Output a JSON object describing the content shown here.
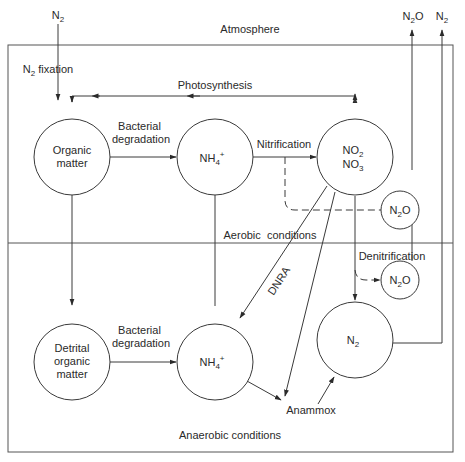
{
  "zones": {
    "atmosphere": "Atmosphere",
    "aerobic": "Aerobic  conditions",
    "anaerobic": "Anaerobic conditions"
  },
  "nodes": {
    "n2_in": {
      "base": "N",
      "sub": "2"
    },
    "n2o_out": {
      "base": "N",
      "sub": "2",
      "tail": "O"
    },
    "n2_out": {
      "base": "N",
      "sub": "2"
    },
    "organic_matter": {
      "line1": "Organic",
      "line2": "matter"
    },
    "nh4_top": {
      "base": "NH",
      "sub": "4",
      "sup": "+"
    },
    "no2_no3": {
      "line1_base": "NO",
      "line1_sub": "2",
      "line2_base": "NO",
      "line2_sub": "3"
    },
    "n2o_upper": {
      "base": "N",
      "sub": "2",
      "tail": "O"
    },
    "n2o_lower": {
      "base": "N",
      "sub": "2",
      "tail": "O"
    },
    "detrital_organic_matter": {
      "line1": "Detrital",
      "line2": "organic",
      "line3": "matter"
    },
    "nh4_bottom": {
      "base": "NH",
      "sub": "4",
      "sup": "+"
    },
    "n2_bottom": {
      "base": "N",
      "sub": "2"
    }
  },
  "processes": {
    "n2_fixation": {
      "base": "N",
      "sub": "2",
      "tail": " fixation"
    },
    "photosynthesis": "Photosynthesis",
    "bacterial_degradation_top": {
      "line1": "Bacterial",
      "line2": "degradation"
    },
    "nitrification": "Nitrification",
    "dnra": "DNRA",
    "denitrification": "Denitrification",
    "bacterial_degradation_bottom": {
      "line1": "Bacterial",
      "line2": "degradation"
    },
    "anammox": "Anammox"
  }
}
